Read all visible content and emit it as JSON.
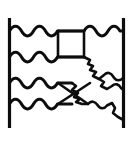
{
  "figure": {
    "title": "line-drawing figure",
    "background_color": "#ffffff",
    "ink_color": "#0d0d0d",
    "canvas": {
      "width": 134,
      "height": 159
    },
    "elements": [
      {
        "name": "left-rail",
        "type": "vertical-line",
        "x": 9,
        "y_start": 18,
        "y_end": 128
      },
      {
        "name": "right-rail",
        "type": "vertical-line",
        "x": 123,
        "y_start": 18,
        "y_end": 128
      },
      {
        "name": "wavy-line-1",
        "type": "wavy-horizontal",
        "y": 31
      },
      {
        "name": "wavy-line-2",
        "type": "wavy-horizontal",
        "y": 57
      },
      {
        "name": "wavy-line-3",
        "type": "wavy-horizontal",
        "y": 83
      },
      {
        "name": "wavy-line-4",
        "type": "wavy-horizontal",
        "y": 104
      },
      {
        "name": "center-box",
        "type": "rectangle",
        "x": 58,
        "y": 31,
        "width": 26,
        "height": 26
      },
      {
        "name": "x-quadrilateral",
        "type": "crossed-box",
        "x": 58,
        "y": 83,
        "width": 30,
        "height": 21
      },
      {
        "name": "jagged-contour-upper",
        "type": "irregular-polyline"
      },
      {
        "name": "jagged-contour-lower",
        "type": "irregular-polyline"
      }
    ]
  }
}
